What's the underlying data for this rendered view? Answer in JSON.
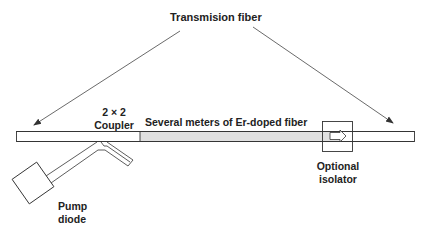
{
  "diagram": {
    "title": "Transmision fiber",
    "labels": {
      "coupler_line1": "2 × 2",
      "coupler_line2": "Coupler",
      "doped_fiber": "Several meters of Er-doped fiber",
      "isolator_line1": "Optional",
      "isolator_line2": "isolator",
      "pump_line1": "Pump",
      "pump_line2": "diode"
    },
    "components": [
      "transmission fiber (input)",
      "2x2 coupler",
      "pump diode",
      "Er-doped fiber",
      "optional isolator",
      "transmission fiber (output)"
    ],
    "colors": {
      "stroke": "#333333",
      "doped_fill": "#e0e0e0",
      "fiber_fill": "#ffffff",
      "text": "#222222"
    }
  }
}
